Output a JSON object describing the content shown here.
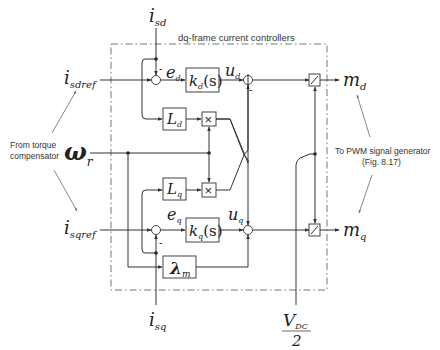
{
  "title": "dq-frame current controllers",
  "inputs": {
    "isd": {
      "main": "i",
      "sub": "sd"
    },
    "isdref": {
      "main": "i",
      "sub": "sdref"
    },
    "isqref": {
      "main": "i",
      "sub": "sqref"
    },
    "isq": {
      "main": "i",
      "sub": "sq"
    },
    "omega": {
      "main": "ω",
      "sub": "r"
    },
    "vdc": {
      "num_main": "V",
      "num_sub": "DC",
      "den": "2"
    }
  },
  "outputs": {
    "md": {
      "main": "m",
      "sub": "d"
    },
    "mq": {
      "main": "m",
      "sub": "q"
    }
  },
  "blocks": {
    "kd": {
      "main": "k",
      "sub": "d",
      "arg": "(s)"
    },
    "kq": {
      "main": "k",
      "sub": "q",
      "arg": "(s)"
    },
    "Ld": {
      "main": "L",
      "sub": "d"
    },
    "Lq": {
      "main": "L",
      "sub": "q"
    },
    "lambda": {
      "main": "λ",
      "sub": "m"
    },
    "mult": "×"
  },
  "signals": {
    "ed": {
      "main": "e",
      "sub": "d"
    },
    "eq": {
      "main": "e",
      "sub": "q"
    },
    "ud": {
      "main": "u",
      "sub": "d"
    },
    "uq": {
      "main": "u",
      "sub": "q"
    },
    "minus": "-"
  },
  "annotations": {
    "left_line1": "From torque",
    "left_line2": "compensator",
    "right_line1": "To PWM signal generator",
    "right_line2": "(Fig. 8.17)"
  }
}
